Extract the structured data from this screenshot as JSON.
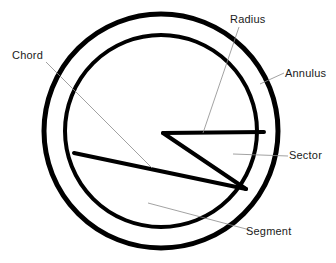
{
  "diagram": {
    "background_color": "#ffffff",
    "stroke_color": "#000000",
    "leader_color": "#8a8a8a",
    "labels": {
      "radius": "Radius",
      "annulus": "Annulus",
      "chord": "Chord",
      "sector": "Sector",
      "segment": "Segment"
    },
    "geometry": {
      "center_x": 161,
      "center_y": 131,
      "outer_radius": 117,
      "inner_radius": 96,
      "outer_stroke_width": 5,
      "inner_stroke_width": 4,
      "sector_apex_x": 163,
      "sector_apex_y": 133,
      "chord_stroke_width": 4,
      "leader_stroke_width": 0.8
    }
  }
}
